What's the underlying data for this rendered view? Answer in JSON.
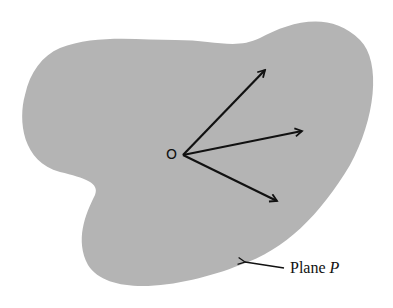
{
  "diagram": {
    "colors": {
      "plane_fill": "#b4b4b4",
      "vector": "#111111",
      "background": "#ffffff"
    },
    "origin_label": "O",
    "plane_label": {
      "text": "Plane",
      "variable": "P"
    },
    "vectors": [
      {
        "from": [
          183,
          155
        ],
        "to": [
          266,
          69
        ]
      },
      {
        "from": [
          183,
          155
        ],
        "to": [
          303,
          131
        ]
      },
      {
        "from": [
          183,
          155
        ],
        "to": [
          278,
          201
        ]
      }
    ]
  }
}
